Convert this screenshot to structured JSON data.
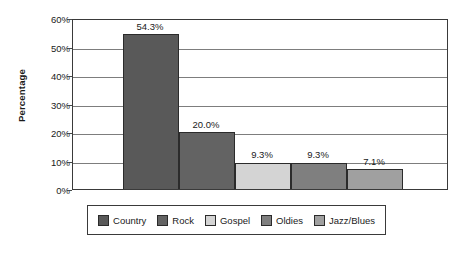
{
  "chart_data": {
    "type": "bar",
    "title": "",
    "xlabel": "",
    "ylabel": "Percentage",
    "ylim": [
      0,
      60
    ],
    "grid": true,
    "grid_axis": "y",
    "legend_position": "bottom",
    "categories": [
      "Country",
      "Rock",
      "Gospel",
      "Oldies",
      "Jazz/Blues"
    ],
    "values": [
      54.3,
      20.0,
      9.3,
      9.3,
      7.1
    ],
    "data_labels": [
      "54.3%",
      "20.0%",
      "9.3%",
      "9.3%",
      "7.1%"
    ],
    "ytick_values": [
      0,
      10,
      20,
      30,
      40,
      50,
      60
    ],
    "ytick_labels": [
      "0%",
      "10%",
      "20%",
      "30%",
      "40%",
      "50%",
      "60%"
    ],
    "minor_tick_values": [
      5,
      15,
      25,
      35,
      45,
      55
    ],
    "series_colors": [
      "#595959",
      "#636363",
      "#d4d4d4",
      "#7f7f7f",
      "#a0a0a0"
    ],
    "legend": [
      {
        "label": "Country",
        "color": "#595959",
        "value": 54.3
      },
      {
        "label": "Rock",
        "color": "#636363",
        "value": 20.0
      },
      {
        "label": "Gospel",
        "color": "#d4d4d4",
        "value": 9.3
      },
      {
        "label": "Oldies",
        "color": "#7f7f7f",
        "value": 9.3
      },
      {
        "label": "Jazz/Blues",
        "color": "#a0a0a0",
        "value": 7.1
      }
    ]
  }
}
